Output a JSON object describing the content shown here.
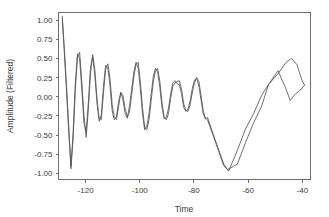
{
  "chart_data": {
    "type": "line",
    "title": "",
    "xlabel": "Time",
    "ylabel": "Amplitude (Filtered)",
    "xlim": [
      -130,
      -37
    ],
    "ylim": [
      -1.08,
      1.1
    ],
    "xticks": [
      -120,
      -100,
      -80,
      -60,
      -40
    ],
    "xticklabels": [
      "-120",
      "-100",
      "-80",
      "-60",
      "-40"
    ],
    "yticks": [
      1.0,
      0.75,
      0.5,
      0.25,
      0.0,
      -0.25,
      -0.5,
      -0.75,
      -1.0
    ],
    "yticklabels": [
      "1.00",
      "0.75",
      "0.50",
      "0.25",
      "0.00",
      "-0.25",
      "-0.50",
      "-0.75",
      "-1.00"
    ],
    "grid": false,
    "legend": false,
    "legend_position": "none",
    "line_color": "#555555",
    "frame_color": "#6e6e6e",
    "text_color": "#3a3a3a",
    "background": "#ffffff",
    "series": [
      {
        "name": "trace-1",
        "color": "#555555",
        "x": [
          -128.6,
          -127.8,
          -127.0,
          -126.2,
          -125.4,
          -124.6,
          -123.8,
          -123.0,
          -122.2,
          -121.4,
          -120.6,
          -119.8,
          -119.0,
          -118.2,
          -117.4,
          -116.6,
          -115.8,
          -115.0,
          -114.2,
          -113.4,
          -112.6,
          -111.8,
          -111.0,
          -110.2,
          -109.4,
          -108.6,
          -107.8,
          -107.0,
          -106.2,
          -105.4,
          -104.6,
          -103.8,
          -103.0,
          -102.2,
          -101.4,
          -100.6,
          -99.8,
          -99.0,
          -98.2,
          -97.4,
          -96.6,
          -95.8,
          -95.0,
          -94.2,
          -93.4,
          -92.6,
          -91.8,
          -91.0,
          -90.2,
          -89.4,
          -88.6,
          -87.8,
          -87.0,
          -86.2,
          -85.4,
          -84.6,
          -83.8,
          -83.0,
          -82.2,
          -81.4,
          -80.6,
          -79.8,
          -79.0,
          -78.2,
          -77.4,
          -76.6,
          -75.8,
          -75.0,
          -72.0,
          -69.0,
          -67.2,
          -64.0,
          -61.0,
          -58.0,
          -55.0,
          -52.5,
          -49.0,
          -46.0,
          -44.5,
          -43.0,
          -41.0,
          -39.2
        ],
        "y": [
          1.05,
          0.6,
          0.12,
          -0.4,
          -0.94,
          -0.55,
          0.08,
          0.52,
          0.58,
          0.2,
          -0.25,
          -0.53,
          -0.18,
          0.3,
          0.55,
          0.36,
          -0.02,
          -0.28,
          -0.3,
          0.05,
          0.36,
          0.43,
          0.24,
          -0.1,
          -0.27,
          -0.3,
          -0.12,
          0.05,
          0.02,
          -0.16,
          -0.26,
          -0.2,
          0.02,
          0.26,
          0.42,
          0.45,
          0.2,
          -0.14,
          -0.4,
          -0.43,
          -0.3,
          -0.05,
          0.2,
          0.34,
          0.37,
          0.2,
          -0.08,
          -0.26,
          -0.3,
          -0.22,
          -0.02,
          0.14,
          0.18,
          0.2,
          0.21,
          0.1,
          -0.09,
          -0.18,
          -0.19,
          -0.1,
          0.06,
          0.18,
          0.25,
          0.2,
          0.02,
          -0.18,
          -0.28,
          -0.3,
          -0.6,
          -0.9,
          -0.97,
          -0.7,
          -0.42,
          -0.22,
          0.02,
          0.16,
          0.34,
          0.1,
          -0.05,
          0.02,
          0.08,
          0.15
        ]
      },
      {
        "name": "trace-2",
        "color": "#555555",
        "x": [
          -128.6,
          -127.8,
          -127.0,
          -126.2,
          -125.4,
          -124.6,
          -123.8,
          -123.0,
          -122.2,
          -121.4,
          -120.6,
          -119.8,
          -119.0,
          -118.2,
          -117.4,
          -116.6,
          -115.8,
          -115.0,
          -114.2,
          -113.4,
          -112.6,
          -111.8,
          -111.0,
          -110.2,
          -109.4,
          -108.6,
          -107.8,
          -107.0,
          -106.2,
          -105.4,
          -104.6,
          -103.8,
          -103.0,
          -102.2,
          -101.4,
          -100.6,
          -99.8,
          -99.0,
          -98.2,
          -97.4,
          -96.6,
          -95.8,
          -95.0,
          -94.2,
          -93.4,
          -92.6,
          -91.8,
          -91.0,
          -90.2,
          -89.4,
          -88.6,
          -87.8,
          -87.0,
          -86.2,
          -85.4,
          -84.6,
          -83.8,
          -83.0,
          -82.2,
          -81.4,
          -80.6,
          -79.8,
          -79.0,
          -78.2,
          -77.4,
          -76.6,
          -75.8,
          -75.0,
          -72.0,
          -69.0,
          -67.6,
          -64.0,
          -61.0,
          -58.0,
          -55.0,
          -52.5,
          -49.0,
          -46.0,
          -44.0,
          -42.0,
          -40.2,
          -39.2
        ],
        "y": [
          1.02,
          0.55,
          0.05,
          -0.48,
          -0.9,
          -0.46,
          0.18,
          0.56,
          0.5,
          0.1,
          -0.34,
          -0.46,
          -0.08,
          0.38,
          0.52,
          0.28,
          -0.08,
          -0.32,
          -0.24,
          0.14,
          0.41,
          0.38,
          0.15,
          -0.18,
          -0.3,
          -0.26,
          -0.06,
          0.06,
          -0.04,
          -0.22,
          -0.28,
          -0.12,
          0.1,
          0.32,
          0.45,
          0.38,
          0.1,
          -0.22,
          -0.43,
          -0.38,
          -0.22,
          0.03,
          0.27,
          0.37,
          0.32,
          0.12,
          -0.14,
          -0.29,
          -0.27,
          -0.15,
          0.04,
          0.18,
          0.21,
          0.17,
          0.16,
          0.04,
          -0.14,
          -0.19,
          -0.16,
          -0.05,
          0.11,
          0.22,
          0.24,
          0.14,
          -0.04,
          -0.22,
          -0.29,
          -0.27,
          -0.58,
          -0.88,
          -0.95,
          -0.88,
          -0.6,
          -0.34,
          -0.12,
          0.16,
          0.3,
          0.45,
          0.5,
          0.42,
          0.22,
          0.15
        ]
      }
    ]
  }
}
